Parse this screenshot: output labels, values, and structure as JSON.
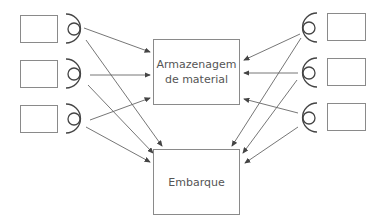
{
  "diagram": {
    "center_boxes": [
      {
        "id": "storage",
        "label_line1": "Armazenagem",
        "label_line2": "de material"
      },
      {
        "id": "shipping",
        "label": "Embarque"
      }
    ],
    "left_sources": 3,
    "right_sources": 3,
    "colors": {
      "stroke": "#8a8a8a",
      "arrow": "#555555",
      "text": "#555555"
    }
  }
}
